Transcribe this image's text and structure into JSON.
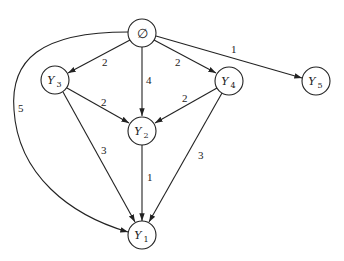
{
  "diagram": {
    "type": "directed weighted graph",
    "nodes": [
      {
        "id": "empty",
        "label": "∅",
        "sub": ""
      },
      {
        "id": "Y3",
        "label": "Y",
        "sub": "3"
      },
      {
        "id": "Y4",
        "label": "Y",
        "sub": "4"
      },
      {
        "id": "Y5",
        "label": "Y",
        "sub": "5"
      },
      {
        "id": "Y2",
        "label": "Y",
        "sub": "2"
      },
      {
        "id": "Y1",
        "label": "Y",
        "sub": "1"
      }
    ],
    "edges": [
      {
        "from": "empty",
        "to": "Y3",
        "weight": "2"
      },
      {
        "from": "empty",
        "to": "Y2",
        "weight": "4"
      },
      {
        "from": "empty",
        "to": "Y4",
        "weight": "2"
      },
      {
        "from": "empty",
        "to": "Y5",
        "weight": "1"
      },
      {
        "from": "empty",
        "to": "Y1",
        "weight": "5"
      },
      {
        "from": "Y3",
        "to": "Y2",
        "weight": "2"
      },
      {
        "from": "Y4",
        "to": "Y2",
        "weight": "2"
      },
      {
        "from": "Y3",
        "to": "Y1",
        "weight": "3"
      },
      {
        "from": "Y2",
        "to": "Y1",
        "weight": "1"
      },
      {
        "from": "Y4",
        "to": "Y1",
        "weight": "3"
      }
    ]
  }
}
